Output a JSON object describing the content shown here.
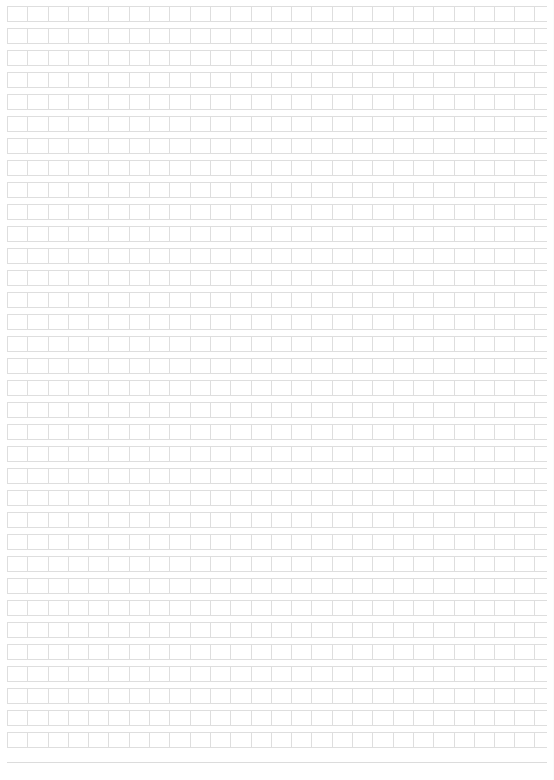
{
  "document": {
    "kind": "blank-squared-manuscript-sheet",
    "title": "",
    "body_text": "",
    "page_number": "",
    "header_text": "",
    "footer_text": ""
  },
  "page": {
    "width_px": 554,
    "height_px": 780,
    "background_color": "#ffffff",
    "margin_left_px": 7,
    "margin_top_px": 6,
    "margin_right_px": 7,
    "margin_bottom_px": 17
  },
  "grid": {
    "columns": 26,
    "rows": 34,
    "cell_width_px": 20.3,
    "cell_height_px": 16,
    "row_gap_px": 6,
    "row_pitch_px": 22,
    "line_color": "#dedede",
    "rule_color": "#dcdcdc",
    "cell_fill_color": "#ffffff",
    "cell_text": ""
  },
  "content": {
    "filled_cells": [],
    "annotations": [],
    "notes": ""
  }
}
